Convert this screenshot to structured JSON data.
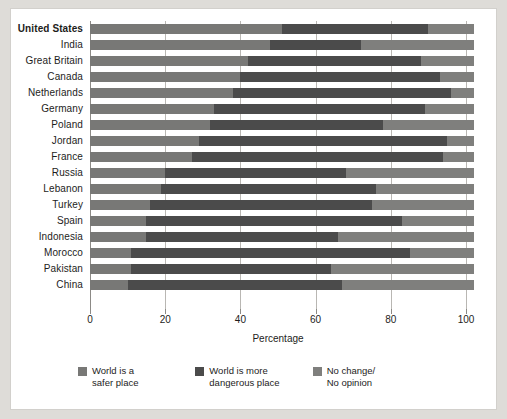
{
  "chart_data": {
    "type": "bar",
    "orientation": "horizontal",
    "stacked": true,
    "title": "",
    "xlabel": "Percentage",
    "ylabel": "",
    "xlim": [
      0,
      100
    ],
    "xticks": [
      0,
      20,
      40,
      60,
      80,
      100
    ],
    "grid": true,
    "legend_position": "bottom",
    "categories": [
      "United States",
      "India",
      "Great Britain",
      "Canada",
      "Netherlands",
      "Germany",
      "Poland",
      "Jordan",
      "France",
      "Russia",
      "Lebanon",
      "Turkey",
      "Spain",
      "Indonesia",
      "Morocco",
      "Pakistan",
      "China"
    ],
    "highlighted_category": "United States",
    "series": [
      {
        "name": "World is a safer place",
        "color": "#787876",
        "values": [
          51,
          48,
          42,
          40,
          38,
          33,
          32,
          29,
          27,
          20,
          19,
          16,
          15,
          15,
          11,
          11,
          10
        ]
      },
      {
        "name": "World is more dangerous place",
        "color": "#4b4b4b",
        "values": [
          39,
          24,
          46,
          53,
          58,
          56,
          46,
          66,
          67,
          48,
          57,
          59,
          68,
          51,
          74,
          53,
          57
        ]
      },
      {
        "name": "No change/ No opinion",
        "color": "#7f7f7d",
        "values": [
          12,
          30,
          14,
          9,
          6,
          13,
          24,
          7,
          8,
          34,
          26,
          27,
          19,
          36,
          17,
          38,
          35
        ]
      }
    ],
    "legend": [
      {
        "label": "World is a\nsafer place",
        "color": "#787876"
      },
      {
        "label": "World is more\ndangerous place",
        "color": "#4b4b4b"
      },
      {
        "label": "No change/\nNo opinion",
        "color": "#7f7f7d"
      }
    ]
  },
  "colors": {
    "page_background": "#dedcd8",
    "card_background": "#ffffff",
    "gridline": "#b9b7b3",
    "text": "#1d1d1b"
  }
}
